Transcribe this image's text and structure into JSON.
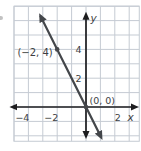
{
  "chart_data": {
    "type": "line",
    "title": "",
    "equation": {
      "slope": -2,
      "intercept": 0
    },
    "line_x_range": [
      -3.17,
      1.06
    ],
    "points": [
      {
        "x": -2,
        "y": 4,
        "label": "(−2, 4)"
      },
      {
        "x": 0,
        "y": 0,
        "label": "(0, 0)"
      }
    ],
    "xlabel": "x",
    "ylabel": "y",
    "x_ticks": [
      {
        "value": -4,
        "label": "−4"
      },
      {
        "value": -2,
        "label": "−2"
      },
      {
        "value": 2,
        "label": "2"
      }
    ],
    "y_ticks": [
      {
        "value": 2,
        "label": "2"
      },
      {
        "value": 4,
        "label": "4"
      }
    ],
    "xlim": [
      -5,
      3.7
    ],
    "ylim": [
      -2.38,
      7
    ],
    "x_axis_extent": [
      -5.15,
      3.5
    ],
    "y_axis_extent": [
      -2.05,
      6.45
    ],
    "grid": true,
    "colors": {
      "grid": "#c5cbd3",
      "axis": "#1d1d1f",
      "line": "#43464a",
      "point": "#46484c",
      "text": "#3c3e42"
    }
  }
}
